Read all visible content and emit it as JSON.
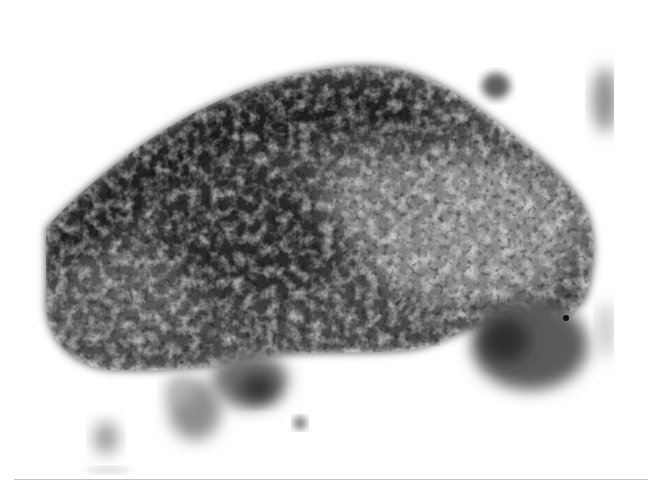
{
  "image": {
    "kind": "grayscale light micrograph",
    "subject": "large irregular dark-stained cell cluster with smaller surrounding cells",
    "background_color": "#ffffff",
    "palette": {
      "darkest": "#1e1e1e",
      "dark": "#3a3a3a",
      "mid": "#6a6a6a",
      "light": "#a8a8a8",
      "faint": "#d6d6d6"
    }
  }
}
